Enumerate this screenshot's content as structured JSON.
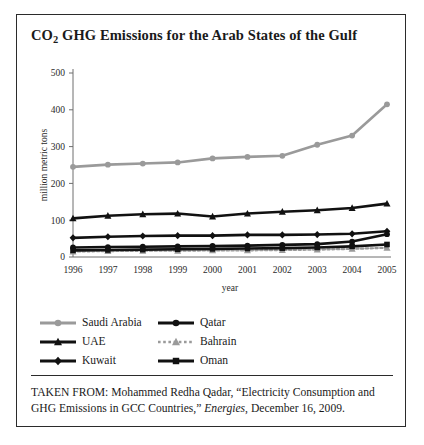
{
  "figure": {
    "title_main": "GHG Emissions for the Arab States of the Gulf",
    "title_prefix": "CO",
    "title_subscript": "2",
    "caption_lead": "TAKEN FROM: Mohammed Redha Qadar, “Electricity Consumption and GHG Emissions in GCC Countries,” ",
    "caption_journal": "Energies",
    "caption_tail": ", December 16, 2009."
  },
  "chart_data": {
    "type": "line",
    "title": "CO2 GHG Emissions for the Arab States of the Gulf",
    "xlabel": "year",
    "ylabel": "million metric tons",
    "categories": [
      "1996",
      "1997",
      "1998",
      "1999",
      "2000",
      "2001",
      "2002",
      "2003",
      "2004",
      "2005"
    ],
    "x": [
      1996,
      1997,
      1998,
      1999,
      2000,
      2001,
      2002,
      2003,
      2004,
      2005
    ],
    "ylim": [
      0,
      500
    ],
    "yticks": [
      0,
      100,
      200,
      300,
      400,
      500
    ],
    "grid": false,
    "legend_position": "below",
    "series": [
      {
        "name": "Saudi Arabia",
        "color": "#9a9a9a",
        "marker": "circle",
        "line_style": "solid",
        "values": [
          245,
          251,
          254,
          257,
          268,
          272,
          275,
          305,
          330,
          415
        ]
      },
      {
        "name": "UAE",
        "color": "#111111",
        "marker": "triangle",
        "line_style": "solid",
        "values": [
          105,
          112,
          116,
          118,
          110,
          118,
          123,
          127,
          133,
          145
        ]
      },
      {
        "name": "Kuwait",
        "color": "#111111",
        "marker": "diamond",
        "line_style": "solid",
        "values": [
          52,
          55,
          57,
          58,
          58,
          60,
          60,
          61,
          63,
          70
        ]
      },
      {
        "name": "Qatar",
        "color": "#111111",
        "marker": "circle",
        "line_style": "solid",
        "values": [
          26,
          27,
          28,
          29,
          30,
          31,
          33,
          35,
          42,
          62
        ]
      },
      {
        "name": "Bahrain",
        "color": "#9a9a9a",
        "marker": "triangle",
        "line_style": "dotted",
        "values": [
          15,
          16,
          17,
          17,
          18,
          18,
          19,
          20,
          22,
          25
        ]
      },
      {
        "name": "Oman",
        "color": "#111111",
        "marker": "square",
        "line_style": "solid",
        "values": [
          18,
          19,
          20,
          21,
          22,
          23,
          24,
          26,
          29,
          34
        ]
      }
    ]
  }
}
